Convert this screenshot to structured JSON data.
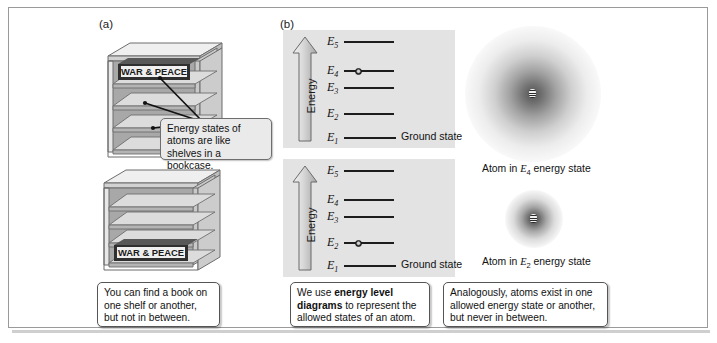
{
  "figure": {
    "panel_a_label": "(a)",
    "panel_b_label": "(b)",
    "border_color": "#9a9a9a",
    "panel_bg_color": "#e3e3e3"
  },
  "bookcase": {
    "book_title": "WAR & PEACE",
    "top_case_book_shelf": 1,
    "bottom_case_book_shelf": 4,
    "shelf_count": 5
  },
  "callout": {
    "text": "Energy states of atoms are like shelves in a bookcase."
  },
  "captions": [
    {
      "id": "caption-bookshelf",
      "text": "You can find a book on one shelf or another, but not in between."
    },
    {
      "id": "caption-diagram",
      "text_before": "We use ",
      "bold": "energy level diagrams",
      "text_after": " to represent the allowed states of an atom."
    },
    {
      "id": "caption-atom",
      "text": "Analogously, atoms exist in one allowed energy state or another, but never in between."
    }
  ],
  "energy_axis": {
    "label": "Energy",
    "direction": "up"
  },
  "ground_state_label": "Ground state",
  "diagrams": [
    {
      "id": "diagram-upper",
      "occupied_level": "E4",
      "levels": [
        {
          "label": "E",
          "sub": "5",
          "y": 41
        },
        {
          "label": "E",
          "sub": "4",
          "y": 70
        },
        {
          "label": "E",
          "sub": "3",
          "y": 87
        },
        {
          "label": "E",
          "sub": "2",
          "y": 113
        },
        {
          "label": "E",
          "sub": "1",
          "y": 137
        }
      ]
    },
    {
      "id": "diagram-lower",
      "occupied_level": "E2",
      "levels": [
        {
          "label": "E",
          "sub": "5",
          "y": 170
        },
        {
          "label": "E",
          "sub": "4",
          "y": 199
        },
        {
          "label": "E",
          "sub": "3",
          "y": 216
        },
        {
          "label": "E",
          "sub": "2",
          "y": 242
        },
        {
          "label": "E",
          "sub": "1",
          "y": 265
        }
      ]
    }
  ],
  "atoms": [
    {
      "id": "atom-e4",
      "caption_before": "Atom in ",
      "symbol": "E",
      "sub": "4",
      "caption_after": " energy state",
      "size": "large"
    },
    {
      "id": "atom-e2",
      "caption_before": "Atom in ",
      "symbol": "E",
      "sub": "2",
      "caption_after": " energy state",
      "size": "small"
    }
  ]
}
